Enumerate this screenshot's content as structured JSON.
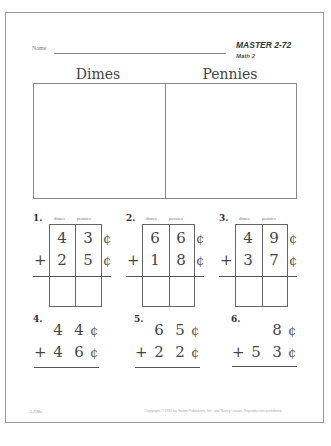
{
  "header": {
    "name_label": "Name",
    "master": "MASTER 2-72",
    "course": "Math 2"
  },
  "sort_box": {
    "left_title": "Dimes",
    "right_title": "Pennies"
  },
  "column_headers": {
    "dimes": "dimes",
    "pennies": "pennies"
  },
  "boxed_problems": [
    {
      "number": "1.",
      "top_dimes": "4",
      "top_pennies": "3",
      "bottom_dimes": "2",
      "bottom_pennies": "5",
      "operator": "+",
      "cent": "¢"
    },
    {
      "number": "2.",
      "top_dimes": "6",
      "top_pennies": "6",
      "bottom_dimes": "1",
      "bottom_pennies": "8",
      "operator": "+",
      "cent": "¢"
    },
    {
      "number": "3.",
      "top_dimes": "4",
      "top_pennies": "9",
      "bottom_dimes": "3",
      "bottom_pennies": "7",
      "operator": "+",
      "cent": "¢"
    }
  ],
  "open_problems": [
    {
      "number": "4.",
      "top_tens": "4",
      "top_ones": "4",
      "bottom_tens": "4",
      "bottom_ones": "6",
      "operator": "+",
      "cent": "¢"
    },
    {
      "number": "5.",
      "top_tens": "6",
      "top_ones": "5",
      "bottom_tens": "2",
      "bottom_ones": "2",
      "operator": "+",
      "cent": "¢"
    },
    {
      "number": "6.",
      "top_tens": "",
      "top_ones": "8",
      "bottom_tens": "5",
      "bottom_ones": "3",
      "operator": "+",
      "cent": "¢"
    }
  ],
  "footer": {
    "code": "2-72Ma",
    "copyright": "Copyright © 1991 by Saxon Publishers, Inc. and Nancy Larson. Reproduction prohibited."
  }
}
